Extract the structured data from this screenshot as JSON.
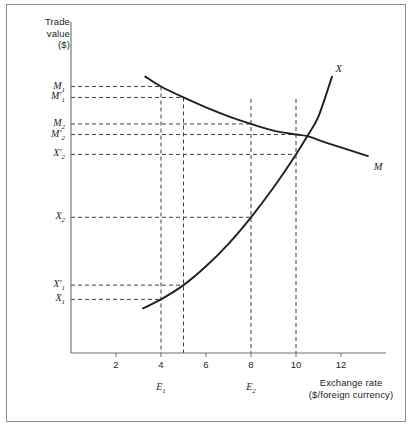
{
  "figure": {
    "y_axis_title": "Trade\nvalue\n($)",
    "y_axis_title_lines": [
      "Trade",
      "value",
      "($)"
    ],
    "x_axis_title_lines": [
      "Exchange rate",
      "($/foreign currency)"
    ]
  },
  "chart_data": {
    "type": "line",
    "title": "",
    "xlabel": "Exchange rate ($/foreign currency)",
    "ylabel": "Trade value ($)",
    "xlim": [
      0,
      14
    ],
    "ylim": [
      0,
      10
    ],
    "grid": false,
    "legend": "inline-curve-labels",
    "xticks": [
      2,
      4,
      6,
      8,
      10,
      12
    ],
    "xtick_labels": [
      "2",
      "4",
      "6",
      "8",
      "10",
      "12"
    ],
    "yticks": [],
    "series": [
      {
        "name": "X",
        "label": "X",
        "description": "Exports curve, upward sloping and convex",
        "points": [
          {
            "x": 3.2,
            "y": 1.35
          },
          {
            "x": 4.0,
            "y": 1.62
          },
          {
            "x": 5.0,
            "y": 2.05
          },
          {
            "x": 6.0,
            "y": 2.62
          },
          {
            "x": 7.0,
            "y": 3.3
          },
          {
            "x": 8.0,
            "y": 4.1
          },
          {
            "x": 9.0,
            "y": 5.0
          },
          {
            "x": 10.0,
            "y": 6.0
          },
          {
            "x": 10.5,
            "y": 6.55
          },
          {
            "x": 11.0,
            "y": 7.15
          },
          {
            "x": 11.6,
            "y": 8.35
          }
        ]
      },
      {
        "name": "M",
        "label": "M",
        "description": "Imports curve, downward sloping and convex",
        "points": [
          {
            "x": 3.3,
            "y": 8.35
          },
          {
            "x": 4.0,
            "y": 8.05
          },
          {
            "x": 5.0,
            "y": 7.72
          },
          {
            "x": 6.0,
            "y": 7.42
          },
          {
            "x": 7.0,
            "y": 7.15
          },
          {
            "x": 8.0,
            "y": 6.92
          },
          {
            "x": 9.0,
            "y": 6.72
          },
          {
            "x": 10.0,
            "y": 6.6
          },
          {
            "x": 10.5,
            "y": 6.55
          },
          {
            "x": 11.5,
            "y": 6.32
          },
          {
            "x": 13.2,
            "y": 5.95
          }
        ]
      }
    ],
    "equilibrium": {
      "x": 10.5,
      "y": 6.55
    },
    "y_value_labels": [
      {
        "label": "M",
        "sub": "1",
        "prime": false,
        "text": "M₁",
        "y": 8.05,
        "x_at": 4.0
      },
      {
        "label": "M",
        "sub": "1",
        "prime": true,
        "text": "M′₁",
        "y": 7.72,
        "x_at": 5.0
      },
      {
        "label": "M",
        "sub": "2",
        "prime": false,
        "text": "M₂",
        "y": 6.92,
        "x_at": 8.0
      },
      {
        "label": "M",
        "sub": "2",
        "prime": true,
        "text": "M′₂",
        "y": 6.6,
        "x_at": 10.0
      },
      {
        "label": "X",
        "sub": "2",
        "prime": true,
        "text": "X′₂",
        "y": 6.0,
        "x_at": 10.0
      },
      {
        "label": "X",
        "sub": "2",
        "prime": false,
        "text": "X₂",
        "y": 4.1,
        "x_at": 8.0
      },
      {
        "label": "X",
        "sub": "1",
        "prime": true,
        "text": "X′₁",
        "y": 2.05,
        "x_at": 5.0
      },
      {
        "label": "X",
        "sub": "1",
        "prime": false,
        "text": "X₁",
        "y": 1.62,
        "x_at": 4.0
      }
    ],
    "x_value_labels": [
      {
        "label": "E",
        "sub": "1",
        "text": "E₁",
        "x": 4.0
      },
      {
        "label": "E",
        "sub": "2",
        "text": "E₂",
        "x": 8.0
      }
    ],
    "dropline_x_positions": [
      4.0,
      5.0,
      8.0,
      10.0
    ],
    "annotations": [
      {
        "text": "X",
        "x": 11.75,
        "y": 8.55,
        "role": "curve-label-exports"
      },
      {
        "text": "M",
        "x": 13.45,
        "y": 5.6,
        "role": "curve-label-imports"
      }
    ]
  },
  "y_labels": {
    "m1": {
      "base": "M",
      "sub": "1",
      "prime": ""
    },
    "m1p": {
      "base": "M",
      "sub": "1",
      "prime": "′"
    },
    "m2": {
      "base": "M",
      "sub": "2",
      "prime": ""
    },
    "m2p": {
      "base": "M",
      "sub": "2",
      "prime": "′"
    },
    "x2p": {
      "base": "X",
      "sub": "2",
      "prime": "′"
    },
    "x2": {
      "base": "X",
      "sub": "2",
      "prime": ""
    },
    "x1p": {
      "base": "X",
      "sub": "1",
      "prime": "′"
    },
    "x1": {
      "base": "X",
      "sub": "1",
      "prime": ""
    }
  },
  "colors": {
    "curve": "#231f20",
    "axis": "#6e6e6e",
    "dash": "#3f3f3f",
    "border": "#8d8d8d",
    "text": "#231f20",
    "background": "#ffffff"
  }
}
